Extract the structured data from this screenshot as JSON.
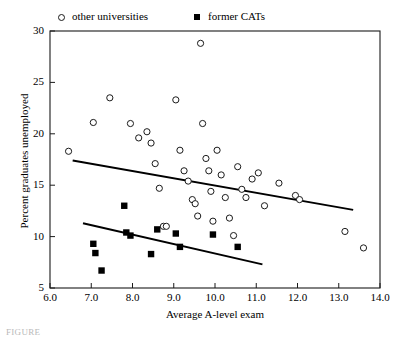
{
  "legend": {
    "items": [
      {
        "label": "other universities",
        "marker": "open-circle",
        "color": "#1a1a1a"
      },
      {
        "label": "former CATs",
        "marker": "filled-square",
        "color": "#000000"
      }
    ]
  },
  "caption": "FIGURE",
  "chart_data": {
    "type": "scatter",
    "title": "",
    "xlabel": "Average A-level exam",
    "ylabel": "Percent graduates unemployed",
    "xlim": [
      6.0,
      14.0
    ],
    "ylim": [
      5,
      30
    ],
    "xticks": [
      "6.0",
      "7.0",
      "8.0",
      "9.0",
      "10.0",
      "11.0",
      "12.0",
      "13.0",
      "14.0"
    ],
    "yticks": [
      "5",
      "10",
      "15",
      "20",
      "25",
      "30"
    ],
    "grid": false,
    "legend_position": "above-plot",
    "series": [
      {
        "name": "other universities",
        "marker": "open-circle",
        "color": "#1a1a1a",
        "points": [
          [
            6.45,
            18.3
          ],
          [
            7.05,
            21.1
          ],
          [
            7.45,
            23.5
          ],
          [
            7.95,
            21.0
          ],
          [
            8.15,
            19.6
          ],
          [
            8.35,
            20.2
          ],
          [
            8.45,
            19.1
          ],
          [
            8.55,
            17.1
          ],
          [
            8.65,
            14.7
          ],
          [
            8.75,
            11.0
          ],
          [
            8.82,
            11.0
          ],
          [
            9.05,
            23.3
          ],
          [
            9.15,
            18.4
          ],
          [
            9.25,
            16.4
          ],
          [
            9.35,
            15.4
          ],
          [
            9.45,
            13.6
          ],
          [
            9.52,
            13.2
          ],
          [
            9.58,
            12.0
          ],
          [
            9.65,
            28.8
          ],
          [
            9.7,
            21.0
          ],
          [
            9.78,
            17.6
          ],
          [
            9.85,
            16.4
          ],
          [
            9.9,
            14.4
          ],
          [
            9.95,
            11.5
          ],
          [
            10.05,
            18.4
          ],
          [
            10.15,
            16.0
          ],
          [
            10.25,
            13.8
          ],
          [
            10.35,
            11.8
          ],
          [
            10.45,
            10.1
          ],
          [
            10.55,
            16.8
          ],
          [
            10.65,
            14.6
          ],
          [
            10.75,
            13.8
          ],
          [
            10.9,
            15.6
          ],
          [
            11.05,
            16.2
          ],
          [
            11.2,
            13.0
          ],
          [
            11.55,
            15.2
          ],
          [
            11.95,
            14.0
          ],
          [
            12.05,
            13.6
          ],
          [
            13.15,
            10.5
          ],
          [
            13.6,
            8.9
          ]
        ]
      },
      {
        "name": "former CATs",
        "marker": "filled-square",
        "color": "#000000",
        "points": [
          [
            7.05,
            9.3
          ],
          [
            7.1,
            8.4
          ],
          [
            7.25,
            6.7
          ],
          [
            7.8,
            13.0
          ],
          [
            7.85,
            10.4
          ],
          [
            7.95,
            10.1
          ],
          [
            8.45,
            8.3
          ],
          [
            8.6,
            10.7
          ],
          [
            9.05,
            10.3
          ],
          [
            9.15,
            9.0
          ],
          [
            9.95,
            10.2
          ],
          [
            10.55,
            9.0
          ]
        ]
      }
    ],
    "trend_lines": [
      {
        "name": "other-universities-trend",
        "x_start": 6.55,
        "y_start": 17.4,
        "x_end": 13.35,
        "y_end": 12.6
      },
      {
        "name": "former-cats-trend",
        "x_start": 6.8,
        "y_start": 11.3,
        "x_end": 11.15,
        "y_end": 7.3
      }
    ]
  }
}
